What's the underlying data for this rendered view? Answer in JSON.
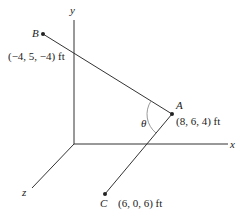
{
  "diagram": {
    "type": "3d-vector-angle",
    "axes": {
      "x": {
        "label": "x"
      },
      "y": {
        "label": "y"
      },
      "z": {
        "label": "z"
      }
    },
    "points": {
      "A": {
        "name": "A",
        "coords": "(8, 6, 4) ft"
      },
      "B": {
        "name": "B",
        "coords": "(−4, 5, −4) ft"
      },
      "C": {
        "name": "C",
        "coords": "(6, 0, 6) ft"
      }
    },
    "angle": {
      "label": "θ"
    },
    "colors": {
      "line": "#333333",
      "arc": "#999999",
      "text": "#222222"
    }
  }
}
